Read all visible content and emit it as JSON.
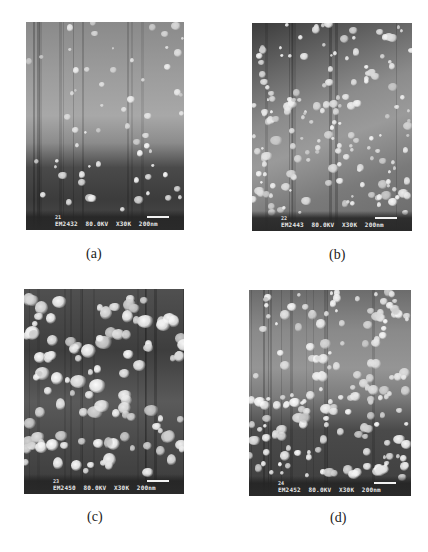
{
  "figure": {
    "panels": [
      {
        "caption": "(a)",
        "image_number": "21",
        "image_id": "EM2432",
        "voltage": "80.0KV",
        "magnification": "X30K",
        "scale_bar": "200nm"
      },
      {
        "caption": "(b)",
        "image_number": "22",
        "image_id": "EM2443",
        "voltage": "80.0KV",
        "magnification": "X30K",
        "scale_bar": "200nm"
      },
      {
        "caption": "(c)",
        "image_number": "23",
        "image_id": "EM2450",
        "voltage": "80.0KV",
        "magnification": "X30K",
        "scale_bar": "200nm"
      },
      {
        "caption": "(d)",
        "image_number": "24",
        "image_id": "EM2452",
        "voltage": "80.0KV",
        "magnification": "X30K",
        "scale_bar": "200nm"
      }
    ]
  }
}
